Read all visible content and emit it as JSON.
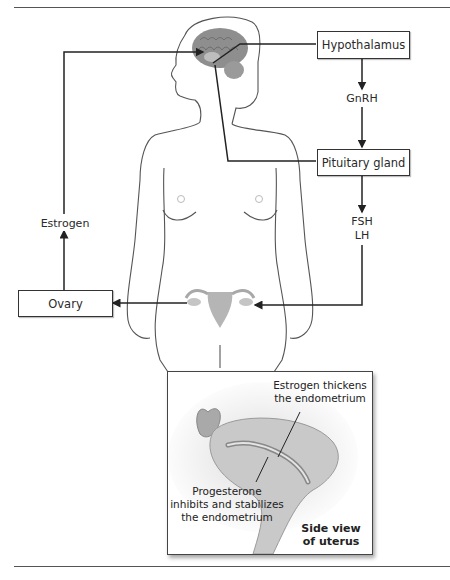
{
  "diagram": {
    "boxes": {
      "hypothalamus": "Hypothalamus",
      "pituitary": "Pituitary gland",
      "ovary": "Ovary"
    },
    "hormones": {
      "gnrh": "GnRH",
      "fsh": "FSH",
      "lh": "LH",
      "estrogen": "Estrogen"
    },
    "inset": {
      "estrogen_note_1": "Estrogen thickens",
      "estrogen_note_2": "the endometrium",
      "progesterone_note_1": "Progesterone",
      "progesterone_note_2": "inhibits and stabilizes",
      "progesterone_note_3": "the endometrium",
      "caption_1": "Side view",
      "caption_2": "of uterus"
    },
    "colors": {
      "line": "#222222",
      "outline": "#555555",
      "brain": "#8a8a8a",
      "uterus": "#b5b5b5"
    }
  }
}
